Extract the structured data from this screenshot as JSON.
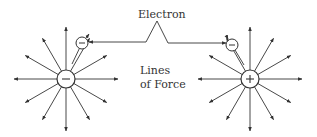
{
  "diagram": {
    "labels": {
      "electron": "Electron",
      "lines_line1": "Lines",
      "lines_line2": "of Force"
    },
    "charges": [
      {
        "id": "negative-charge",
        "sign": "−",
        "cx": 66,
        "cy": 79,
        "r": 9,
        "field_direction": "inward"
      },
      {
        "id": "positive-charge",
        "sign": "+",
        "cx": 250,
        "cy": 79,
        "r": 9,
        "field_direction": "outward"
      }
    ],
    "electrons": [
      {
        "id": "electron-left",
        "sign": "−",
        "cx": 82,
        "cy": 43,
        "r": 6
      },
      {
        "id": "electron-right",
        "sign": "−",
        "cx": 232,
        "cy": 45,
        "r": 6
      }
    ],
    "ray_count": 12,
    "colors": {
      "stroke": "#333333",
      "background": "#ffffff"
    }
  }
}
